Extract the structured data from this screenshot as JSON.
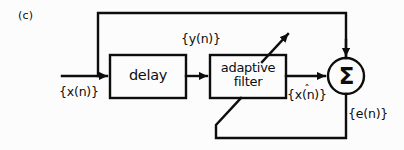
{
  "figure": {
    "panel_label": "(c)",
    "type": "block-diagram",
    "background_color": "#fcfcfc",
    "stroke_color": "#0d0d0d"
  },
  "blocks": [
    {
      "id": "delay",
      "label": "delay",
      "shape": "rectangle",
      "x": 110,
      "y": 55,
      "width": 76,
      "height": 43
    },
    {
      "id": "adaptive_filter",
      "label_line1": "adaptive",
      "label_line2": "filter",
      "shape": "rectangle",
      "x": 210,
      "y": 55,
      "width": 76,
      "height": 43
    },
    {
      "id": "summer",
      "label": "Σ",
      "shape": "circle",
      "cx": 346,
      "cy": 76,
      "r": 18
    }
  ],
  "signals": {
    "input": "{x(n)}",
    "delayed": "{y(n)}",
    "estimate": "{x̂(n)}",
    "estimate_base": "{x(n)}",
    "estimate_hat": "ˆ",
    "error": "{e(n)}"
  },
  "connections": [
    {
      "from": "input-source",
      "to": "delay",
      "kind": "arrow",
      "signal": "{x(n)}"
    },
    {
      "from": "delay",
      "to": "adaptive_filter",
      "kind": "arrow",
      "signal": "{y(n)}"
    },
    {
      "from": "adaptive_filter",
      "to": "summer",
      "kind": "arrow",
      "signal": "{x̂(n)}"
    },
    {
      "from": "summer",
      "to": "input-node",
      "kind": "feedback-top",
      "signal": "{x(n)}"
    },
    {
      "from": "summer",
      "to": "adaptive_filter",
      "kind": "feedback-bottom",
      "signal": "{e(n)}"
    },
    {
      "from": "adaptive_filter",
      "to": "output-tap",
      "kind": "diagonal-arrow",
      "signal": ""
    }
  ]
}
